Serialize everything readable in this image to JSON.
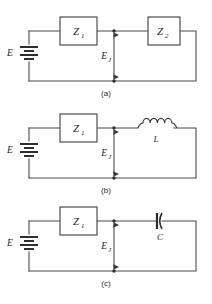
{
  "figure": {
    "background_color": "#fefefe",
    "wire_color": "#4a4a4a",
    "label_color": "#1f1f1f",
    "panels": [
      {
        "id": "a",
        "caption": "(a)",
        "source_label": "E",
        "source_symbol": "battery-icon",
        "series_block_label": "Z",
        "series_block_subscript": "1",
        "load_kind": "impedance-box",
        "load_label": "Z",
        "load_subscript": "2",
        "junction_label": "E",
        "junction_subscript": "J"
      },
      {
        "id": "b",
        "caption": "(b)",
        "source_label": "E",
        "source_symbol": "battery-icon",
        "series_block_label": "Z",
        "series_block_subscript": "1",
        "load_kind": "inductor",
        "load_label": "L",
        "load_subscript": "",
        "junction_label": "E",
        "junction_subscript": "J",
        "inductor_coil_count": 4
      },
      {
        "id": "c",
        "caption": "(c)",
        "source_label": "E",
        "source_symbol": "battery-icon",
        "series_block_label": "Z",
        "series_block_subscript": "1",
        "load_kind": "capacitor",
        "load_label": "C",
        "load_subscript": "",
        "junction_label": "E",
        "junction_subscript": "J"
      }
    ]
  }
}
